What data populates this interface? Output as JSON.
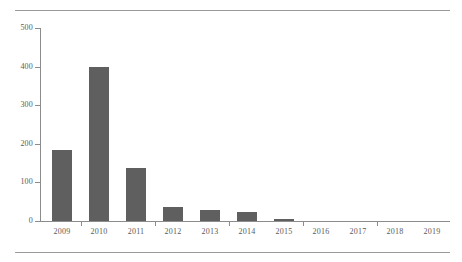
{
  "chart_data": {
    "type": "bar",
    "title": "",
    "subtitle": "",
    "xlabel": "",
    "ylabel": "",
    "categories": [
      "2009",
      "2010",
      "2011",
      "2012",
      "2013",
      "2014",
      "2015",
      "2016",
      "2017",
      "2018",
      "2019"
    ],
    "values": [
      183,
      400,
      138,
      37,
      28,
      24,
      5,
      0,
      0,
      0,
      0
    ],
    "series": [
      {
        "name": "",
        "values": [
          183,
          400,
          138,
          37,
          28,
          24,
          5,
          0,
          0,
          0,
          0
        ]
      }
    ],
    "ylim": [
      0,
      500
    ],
    "yticks": [
      0,
      100,
      200,
      300,
      400,
      500
    ],
    "ytick_labels": [
      "0",
      "100",
      "200",
      "300",
      "400",
      "500"
    ],
    "grid": false,
    "legend": false,
    "legend_position": "none",
    "annotations": [],
    "colors": {
      "bar": "#5f5f5f",
      "axis": "#8c8c8c",
      "tick_text": "#5a5a5a",
      "rule": "#9a9a9a",
      "background": "#ffffff"
    }
  },
  "decor": {
    "top_rule": "",
    "bottom_rule": ""
  }
}
